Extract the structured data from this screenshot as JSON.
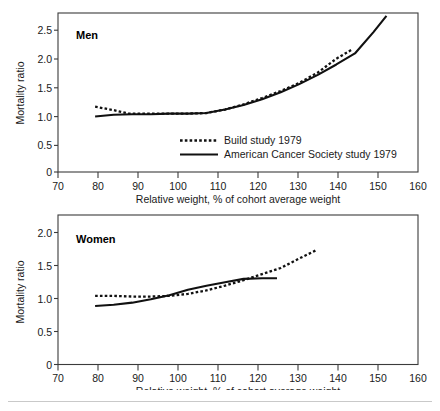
{
  "figure": {
    "background_color": "#ffffff",
    "line_color": "#111111",
    "axis_color": "#3b3b3b",
    "divider_color": "#c9c9c9"
  },
  "panels": [
    {
      "id": "men",
      "label": "Men",
      "y_title": "Mortality ratio",
      "x_title": "Relative weight, % of cohort average weight",
      "x_ticks": [
        "70",
        "80",
        "90",
        "100",
        "110",
        "120",
        "130",
        "140",
        "150",
        "160"
      ],
      "y_ticks": [
        "0",
        "0.5",
        "1.0",
        "1.5",
        "2.0",
        "2.5"
      ]
    },
    {
      "id": "women",
      "label": "Women",
      "y_title": "Mortality ratio",
      "x_title": "Relative weight, % of cohort average weight",
      "x_ticks": [
        "70",
        "80",
        "90",
        "100",
        "110",
        "120",
        "130",
        "140",
        "150",
        "160"
      ],
      "y_ticks": [
        "0",
        "0.5",
        "1.0",
        "1.5",
        "2.0"
      ]
    }
  ],
  "legend": {
    "position": "inside-lower-center",
    "entries": [
      {
        "label": "Build study 1979",
        "style": "dotted"
      },
      {
        "label": "American Cancer Society study 1979",
        "style": "solid"
      }
    ]
  },
  "chart_data": [
    {
      "type": "line",
      "title": "Men",
      "xlabel": "Relative weight, % of cohort average weight",
      "ylabel": "Mortality ratio",
      "xlim": [
        70,
        167
      ],
      "ylim": [
        0,
        2.75
      ],
      "xticks": [
        70,
        80,
        90,
        100,
        110,
        120,
        130,
        140,
        150,
        160
      ],
      "yticks": [
        0,
        0.5,
        1.0,
        1.5,
        2.0,
        2.5
      ],
      "grid": false,
      "legend_entries": [
        "Build study 1979",
        "American Cancer Society study 1979"
      ],
      "series": [
        {
          "name": "Build study 1979",
          "style": "dotted",
          "x": [
            80,
            85,
            89,
            95,
            100,
            105,
            110,
            115,
            120,
            125,
            130,
            135,
            140,
            145,
            149
          ],
          "y": [
            1.13,
            1.07,
            1.01,
            1.01,
            1.01,
            1.01,
            1.02,
            1.08,
            1.17,
            1.28,
            1.4,
            1.54,
            1.72,
            1.96,
            2.11
          ]
        },
        {
          "name": "American Cancer Society study 1979",
          "style": "solid",
          "x": [
            80,
            85,
            90,
            95,
            100,
            105,
            110,
            115,
            120,
            125,
            130,
            135,
            140,
            145,
            150,
            155,
            158.5
          ],
          "y": [
            0.96,
            0.99,
            1.0,
            1.0,
            1.01,
            1.01,
            1.02,
            1.08,
            1.16,
            1.26,
            1.38,
            1.52,
            1.68,
            1.86,
            2.05,
            2.42,
            2.7
          ]
        }
      ]
    },
    {
      "type": "line",
      "title": "Women",
      "xlabel": "Relative weight, % of cohort average weight",
      "ylabel": "Mortality ratio",
      "xlim": [
        70,
        167
      ],
      "ylim": [
        0,
        2.2
      ],
      "xticks": [
        70,
        80,
        90,
        100,
        110,
        120,
        130,
        140,
        150,
        160
      ],
      "yticks": [
        0,
        0.5,
        1.0,
        1.5,
        2.0
      ],
      "grid": false,
      "legend_entries": [
        "Build study 1979",
        "American Cancer Society study 1979"
      ],
      "series": [
        {
          "name": "Build study 1979",
          "style": "dotted",
          "x": [
            80,
            85,
            90,
            95,
            100,
            105,
            110,
            115,
            120,
            125,
            130,
            135,
            139.5
          ],
          "y": [
            1.01,
            1.01,
            1.0,
            1.0,
            1.01,
            1.04,
            1.09,
            1.16,
            1.24,
            1.33,
            1.42,
            1.56,
            1.68
          ]
        },
        {
          "name": "American Cancer Society study 1979",
          "style": "solid",
          "x": [
            80,
            85,
            90,
            95,
            100,
            105,
            110,
            115,
            120,
            125,
            129
          ],
          "y": [
            0.86,
            0.88,
            0.91,
            0.96,
            1.02,
            1.1,
            1.16,
            1.21,
            1.26,
            1.27,
            1.27
          ]
        }
      ]
    }
  ]
}
